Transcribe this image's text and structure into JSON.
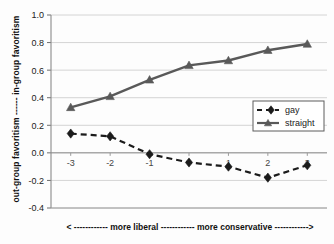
{
  "chart_data": {
    "type": "line",
    "title": "",
    "xlabel": "<  ------------  more liberal  ------------  more conservative  ------------>",
    "ylabel": "out-group favoritism  ------  in-group favoritism",
    "x": [
      -3,
      -2,
      -1,
      0,
      1,
      2,
      3
    ],
    "xticklabels": [
      "-3",
      "-2",
      "-1",
      "",
      "1",
      "2",
      "3"
    ],
    "xticklabels_shown": [
      "-3",
      "-2",
      "-1",
      "1",
      "2",
      "3"
    ],
    "yticklabels": [
      "1.0",
      "0.8",
      "0.6",
      "0.4",
      "0.2",
      "0.0",
      "-0.2",
      "-0.4"
    ],
    "yticks": [
      1.0,
      0.8,
      0.6,
      0.4,
      0.2,
      0.0,
      -0.2,
      -0.4
    ],
    "ylim": [
      -0.4,
      1.0
    ],
    "xlim": [
      -3.5,
      3.5
    ],
    "grid": "horizontal",
    "legend_position": "right-middle",
    "series": [
      {
        "name": "gay",
        "values": [
          0.14,
          0.12,
          -0.01,
          -0.07,
          -0.1,
          -0.18,
          -0.09
        ],
        "marker": "diamond",
        "linestyle": "dashed",
        "color": "#1b1b1b"
      },
      {
        "name": "straight",
        "values": [
          0.33,
          0.41,
          0.53,
          0.635,
          0.67,
          0.745,
          0.79
        ],
        "marker": "triangle",
        "linestyle": "solid",
        "color": "#595959"
      }
    ]
  },
  "legend": {
    "items": [
      {
        "label": "gay"
      },
      {
        "label": "straight"
      }
    ]
  },
  "axes": {
    "y_axis_label": "out-group favoritism  ------  in-group favoritism",
    "x_axis_label": "<  ------------  more liberal  ------------  more conservative  ------------>"
  },
  "colors": {
    "gay_series": "#1b1b1b",
    "straight_series": "#595959",
    "gridline": "#c9c9c9",
    "axis": "#8a8a8a",
    "background": "#fdfdfd"
  }
}
